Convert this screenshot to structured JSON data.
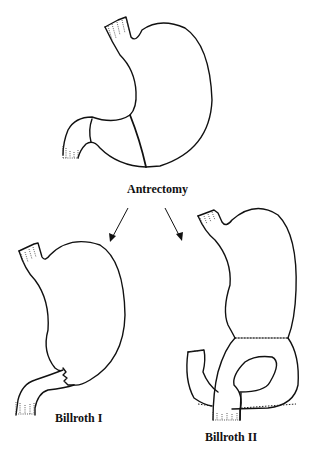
{
  "diagram": {
    "title_label": "Antrectomy",
    "procedures": [
      {
        "label": "Billroth I"
      },
      {
        "label": "Billroth II"
      }
    ],
    "colors": {
      "line": "#111111",
      "background": "#ffffff"
    }
  }
}
